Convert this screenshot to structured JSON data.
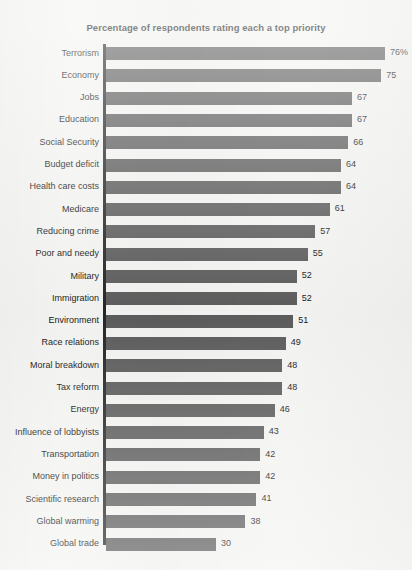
{
  "chart_data": {
    "type": "bar",
    "orientation": "horizontal",
    "title": "Percentage of respondents rating each a top priority",
    "xlabel": "",
    "ylabel": "",
    "xlim": [
      0,
      76
    ],
    "grid": false,
    "legend": null,
    "value_suffix_first": "%",
    "categories": [
      "Terrorism",
      "Economy",
      "Jobs",
      "Education",
      "Social Security",
      "Budget deficit",
      "Health care costs",
      "Medicare",
      "Reducing crime",
      "Poor and needy",
      "Military",
      "Immigration",
      "Environment",
      "Race relations",
      "Moral breakdown",
      "Tax reform",
      "Energy",
      "Influence of lobbyists",
      "Transportation",
      "Money in politics",
      "Scientific research",
      "Global warming",
      "Global trade"
    ],
    "values": [
      76,
      75,
      67,
      67,
      66,
      64,
      64,
      61,
      57,
      55,
      52,
      52,
      51,
      49,
      48,
      48,
      46,
      43,
      42,
      42,
      41,
      38,
      30
    ],
    "value_labels": [
      "76%",
      "75",
      "67",
      "67",
      "66",
      "64",
      "64",
      "61",
      "57",
      "55",
      "52",
      "52",
      "51",
      "49",
      "48",
      "48",
      "46",
      "43",
      "42",
      "42",
      "41",
      "38",
      "30"
    ],
    "colors": {
      "bar": "#5c5c5c",
      "axis": "#262626",
      "background": "#f4f4f2",
      "text": "#161616"
    }
  }
}
